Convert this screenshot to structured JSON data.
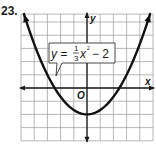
{
  "problem_number": "23.",
  "chart_data": {
    "type": "line",
    "title": "",
    "function": "y = (1/3)x^2 - 2",
    "equation_label": {
      "lhs": "y =",
      "frac_num": "1",
      "frac_den": "3",
      "var": "x",
      "exponent": "2",
      "rest": "− 2"
    },
    "xlabel": "x",
    "ylabel": "y",
    "origin_label": "O",
    "xlim": [
      -5,
      5
    ],
    "ylim": [
      -4,
      5.6
    ],
    "grid": true,
    "grid_step": 1,
    "series": [
      {
        "name": "y = 1/3 x^2 - 2",
        "coefficient_a": 0.3333,
        "constant_c": -2,
        "vertex": [
          0,
          -2
        ],
        "x_intercepts": [
          -2.449,
          2.449
        ],
        "arrows_both_ends": true,
        "color": "#111111"
      }
    ]
  }
}
